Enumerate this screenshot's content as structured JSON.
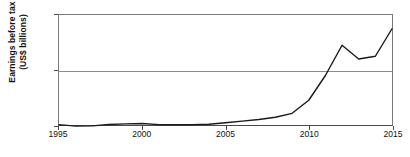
{
  "chart_data": {
    "type": "line",
    "title": "",
    "xlabel": "",
    "ylabel_line1": "Earnings before tax",
    "ylabel_line2": "(US$ billions)",
    "xlim": [
      1995,
      2015
    ],
    "ylim": [
      0,
      80
    ],
    "yticks": [
      0,
      40,
      80
    ],
    "ytick_labels": [
      "0",
      "40",
      "80"
    ],
    "xticks": [
      1995,
      2000,
      2005,
      2010,
      2015
    ],
    "xtick_labels": [
      "1995",
      "2000",
      "2005",
      "2010",
      "2015"
    ],
    "grid": "horizontal-at-40",
    "legend": "none",
    "line_color": "#1a1a1a",
    "axis_color": "#4a4a4a",
    "grid_color": "#8c8c8c",
    "x": [
      1995,
      1996,
      1997,
      1998,
      1999,
      2000,
      2001,
      2002,
      2003,
      2004,
      2005,
      2006,
      2007,
      2008,
      2009,
      2010,
      2011,
      2012,
      2013,
      2014,
      2015
    ],
    "values": [
      0.3,
      -0.8,
      -0.6,
      0.4,
      0.8,
      1.1,
      0.3,
      0.2,
      0.3,
      0.5,
      1.6,
      2.8,
      4.0,
      5.6,
      8.5,
      18,
      36,
      58,
      48,
      50,
      70
    ],
    "series": [
      {
        "name": "Earnings before tax",
        "values": [
          0.3,
          -0.8,
          -0.6,
          0.4,
          0.8,
          1.1,
          0.3,
          0.2,
          0.3,
          0.5,
          1.6,
          2.8,
          4.0,
          5.6,
          8.5,
          18,
          36,
          58,
          48,
          50,
          70
        ]
      }
    ]
  }
}
